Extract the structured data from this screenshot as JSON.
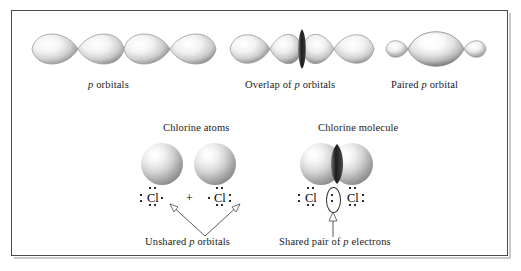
{
  "figure": {
    "background": "#ffffff",
    "frame_color": "#4a4a4a"
  },
  "top_row": {
    "captions": [
      {
        "id": "p-orbitals",
        "text": "p orbitals",
        "italic_lead": "p",
        "rest": " orbitals"
      },
      {
        "id": "overlap-of-p-orbitals",
        "pre": "Overlap of ",
        "italic": "p",
        "post": " orbitals"
      },
      {
        "id": "paired-p-orbital",
        "pre": "Paired ",
        "italic": "p",
        "post": " orbital"
      }
    ],
    "groups": [
      {
        "name": "p-orbital-pair-left",
        "lobes": 2,
        "description": "two teardrop lobes meeting at a point"
      },
      {
        "name": "p-orbital-pair-right",
        "lobes": 2,
        "description": "two teardrop lobes meeting at a point"
      },
      {
        "name": "overlapping-p-orbitals",
        "lobes": 4,
        "description": "four lobes with dark overlap band at center"
      },
      {
        "name": "paired-p-orbital",
        "lobes": 3,
        "description": "large central lens lobe with two small outer lobes"
      }
    ]
  },
  "bottom_row": {
    "left": {
      "heading": "Chlorine atoms",
      "lewis_left": "Cl",
      "operator": "+",
      "lewis_right": "Cl",
      "annotation": {
        "pre": "Unshared ",
        "italic": "p",
        "post": " orbitals"
      },
      "spheres": 2,
      "arrow_count": 2
    },
    "right": {
      "heading": "Chlorine molecule",
      "lewis_left": "Cl",
      "lewis_right": "Cl",
      "shared_pair_symbol": ":",
      "annotation": {
        "pre": "Shared pair of ",
        "italic": "p",
        "post": " electrons"
      },
      "spheres": 2,
      "arrow_count": 1,
      "highlight_shape": "ellipse"
    }
  },
  "colors": {
    "ink": "#111111",
    "frame": "#4a4a4a",
    "lobe_edge": "#8a8a8a",
    "overlap_dark": "#2a2a2a"
  }
}
